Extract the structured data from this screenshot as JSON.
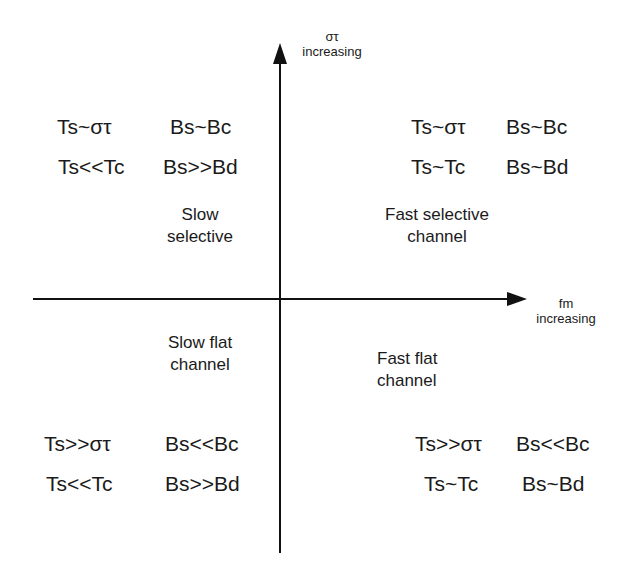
{
  "diagram": {
    "y_axis": {
      "symbol": "στ",
      "label": "increasing"
    },
    "x_axis": {
      "symbol": "fm",
      "label": "increasing"
    },
    "quadrants": {
      "top_left": {
        "title_line1": "Slow",
        "title_line2": "selective",
        "row1": {
          "ts": "Ts~στ",
          "bs": "Bs~Bc"
        },
        "row2": {
          "ts": "Ts<<Tc",
          "bs": "Bs>>Bd"
        }
      },
      "top_right": {
        "title_line1": "Fast selective",
        "title_line2": "channel",
        "row1": {
          "ts": "Ts~στ",
          "bs": "Bs~Bc"
        },
        "row2": {
          "ts": "Ts~Tc",
          "bs": "Bs~Bd"
        }
      },
      "bottom_left": {
        "title_line1": "Slow flat",
        "title_line2": "channel",
        "row1": {
          "ts": "Ts>>στ",
          "bs": "Bs<<Bc"
        },
        "row2": {
          "ts": "Ts<<Tc",
          "bs": "Bs>>Bd"
        }
      },
      "bottom_right": {
        "title_line1": "Fast flat",
        "title_line2": "channel",
        "row1": {
          "ts": "Ts>>στ",
          "bs": "Bs<<Bc"
        },
        "row2": {
          "ts": "Ts~Tc",
          "bs": "Bs~Bd"
        }
      }
    },
    "colors": {
      "line": "#111111",
      "text": "#1a1a1a",
      "background": "#ffffff"
    }
  }
}
